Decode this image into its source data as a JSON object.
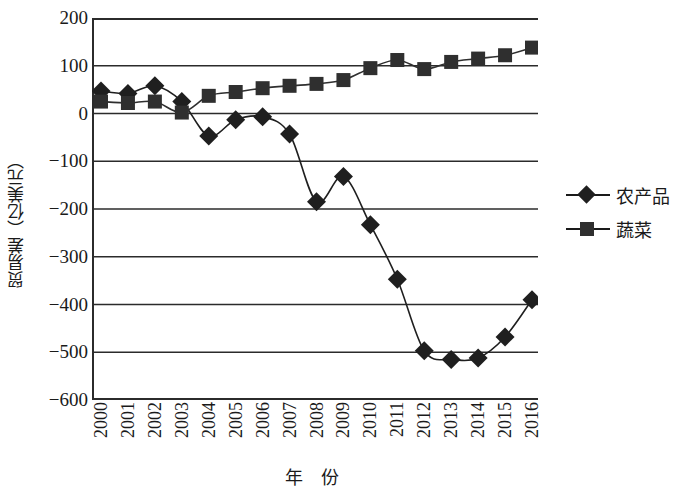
{
  "chart_data": {
    "type": "line",
    "title": "",
    "xlabel": "年  份",
    "ylabel": "贸易差（亿美元）",
    "x": [
      2000,
      2001,
      2002,
      2003,
      2004,
      2005,
      2006,
      2007,
      2008,
      2009,
      2010,
      2011,
      2012,
      2013,
      2014,
      2015,
      2016
    ],
    "categories": [
      "2000",
      "2001",
      "2002",
      "2003",
      "2004",
      "2005",
      "2006",
      "2007",
      "2008",
      "2009",
      "2010",
      "2011",
      "2012",
      "2013",
      "2014",
      "2015",
      "2016"
    ],
    "series": [
      {
        "name": "农产品",
        "marker": "diamond",
        "color": "#1f1f1f",
        "values": [
          47,
          42,
          58,
          25,
          -47,
          -13,
          -7,
          -43,
          -185,
          -132,
          -233,
          -347,
          -497,
          -515,
          -512,
          -468,
          -390
        ]
      },
      {
        "name": "蔬菜",
        "marker": "square",
        "color": "#2f2f2f",
        "values": [
          25,
          22,
          25,
          2,
          37,
          45,
          53,
          58,
          62,
          70,
          95,
          112,
          93,
          108,
          115,
          122,
          138
        ]
      }
    ],
    "ylim": [
      -600,
      200
    ],
    "yticks": [
      200,
      100,
      0,
      -100,
      -200,
      -300,
      -400,
      -500,
      -600
    ],
    "ytick_labels": [
      "200",
      "100",
      "0",
      "−100",
      "−200",
      "−300",
      "−400",
      "−500",
      "−600"
    ],
    "xlim": [
      2000,
      2016
    ],
    "grid": "horizontal",
    "legend_position": "right"
  },
  "legend": {
    "items": [
      {
        "label": "农产品",
        "marker": "diamond"
      },
      {
        "label": "蔬菜",
        "marker": "square"
      }
    ]
  }
}
